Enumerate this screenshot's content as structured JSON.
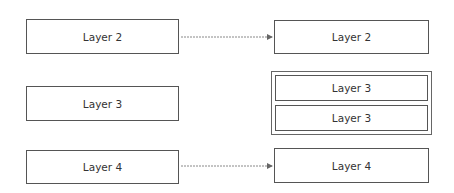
{
  "diagram": {
    "left_column": [
      {
        "id": "left-layer-2",
        "label": "Layer 2"
      },
      {
        "id": "left-layer-3",
        "label": "Layer 3"
      },
      {
        "id": "left-layer-4",
        "label": "Layer 4"
      }
    ],
    "right_column": {
      "top": {
        "id": "right-layer-2",
        "label": "Layer 2"
      },
      "group": [
        {
          "id": "right-layer-3a",
          "label": "Layer 3"
        },
        {
          "id": "right-layer-3b",
          "label": "Layer 3"
        }
      ],
      "bottom": {
        "id": "right-layer-4",
        "label": "Layer 4"
      }
    },
    "edges": [
      {
        "from": "left-layer-2",
        "to": "right-layer-2",
        "style": "dotted-arrow"
      },
      {
        "from": "left-layer-4",
        "to": "right-layer-4",
        "style": "dotted-arrow"
      }
    ],
    "colors": {
      "border": "#555555",
      "text": "#333333",
      "arrow": "#888888"
    }
  }
}
